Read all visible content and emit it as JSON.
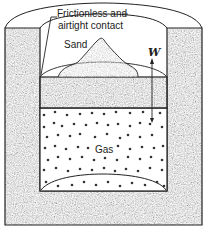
{
  "diagram": {
    "type": "piston-cylinder",
    "labels": {
      "contact_line1": "Frictionless and",
      "contact_line2": "airtight contact",
      "sand": "Sand",
      "weight": "W",
      "gas": "Gas"
    },
    "colors": {
      "wall_fill": "#8a8a8a",
      "piston_fill": "#9a9a9a",
      "sand_fill": "#c8c8c8",
      "gas_fill": "#ffffff",
      "outline": "#222222",
      "dot": "#333333"
    }
  }
}
